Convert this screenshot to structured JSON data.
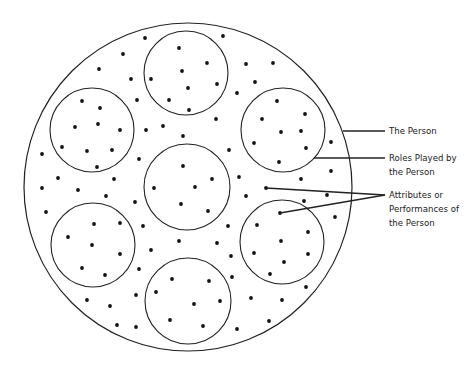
{
  "labels": {
    "person": "The Person",
    "roles_line1": "Roles Played by",
    "roles_line2": "the Person",
    "attr_line1": "Attributes or",
    "attr_line2": "Performances of",
    "attr_line3": "the Person"
  },
  "colors": {
    "stroke": "#222222",
    "dot": "#111111",
    "background": "#ffffff"
  },
  "outer_circle": {
    "cx": 188,
    "cy": 187,
    "r": 164
  },
  "inner_circles": [
    {
      "name": "role-top",
      "cx": 186,
      "cy": 73,
      "r": 42
    },
    {
      "name": "role-upper-left",
      "cx": 92,
      "cy": 130,
      "r": 42
    },
    {
      "name": "role-upper-right",
      "cx": 283,
      "cy": 130,
      "r": 42
    },
    {
      "name": "role-center",
      "cx": 187,
      "cy": 187,
      "r": 43
    },
    {
      "name": "role-lower-left",
      "cx": 93,
      "cy": 245,
      "r": 42
    },
    {
      "name": "role-lower-right",
      "cx": 282,
      "cy": 242,
      "r": 42
    },
    {
      "name": "role-bottom",
      "cx": 188,
      "cy": 301,
      "r": 43
    }
  ],
  "dots": [
    [
      145,
      38
    ],
    [
      223,
      36
    ],
    [
      123,
      54
    ],
    [
      99,
      69
    ],
    [
      131,
      79
    ],
    [
      151,
      79
    ],
    [
      179,
      48
    ],
    [
      207,
      63
    ],
    [
      182,
      71
    ],
    [
      217,
      84
    ],
    [
      188,
      88
    ],
    [
      169,
      100
    ],
    [
      189,
      110
    ],
    [
      246,
      64
    ],
    [
      273,
      63
    ],
    [
      255,
      82
    ],
    [
      237,
      93
    ],
    [
      137,
      100
    ],
    [
      82,
      101
    ],
    [
      100,
      108
    ],
    [
      98,
      124
    ],
    [
      75,
      127
    ],
    [
      120,
      130
    ],
    [
      62,
      147
    ],
    [
      87,
      151
    ],
    [
      112,
      150
    ],
    [
      97,
      167
    ],
    [
      146,
      130
    ],
    [
      163,
      126
    ],
    [
      183,
      136
    ],
    [
      216,
      119
    ],
    [
      42,
      154
    ],
    [
      139,
      159
    ],
    [
      229,
      150
    ],
    [
      277,
      101
    ],
    [
      305,
      114
    ],
    [
      262,
      119
    ],
    [
      281,
      132
    ],
    [
      301,
      131
    ],
    [
      254,
      143
    ],
    [
      306,
      148
    ],
    [
      279,
      162
    ],
    [
      331,
      142
    ],
    [
      331,
      171
    ],
    [
      301,
      179
    ],
    [
      183,
      166
    ],
    [
      212,
      179
    ],
    [
      195,
      187
    ],
    [
      154,
      188
    ],
    [
      239,
      177
    ],
    [
      58,
      178
    ],
    [
      114,
      179
    ],
    [
      42,
      188
    ],
    [
      78,
      190
    ],
    [
      266,
      188
    ],
    [
      106,
      196
    ],
    [
      135,
      202
    ],
    [
      181,
      204
    ],
    [
      208,
      211
    ],
    [
      246,
      196
    ],
    [
      304,
      201
    ],
    [
      327,
      195
    ],
    [
      335,
      217
    ],
    [
      280,
      213
    ],
    [
      46,
      212
    ],
    [
      94,
      224
    ],
    [
      120,
      223
    ],
    [
      68,
      237
    ],
    [
      92,
      245
    ],
    [
      120,
      254
    ],
    [
      82,
      268
    ],
    [
      105,
      275
    ],
    [
      143,
      226
    ],
    [
      151,
      250
    ],
    [
      179,
      241
    ],
    [
      217,
      243
    ],
    [
      228,
      226
    ],
    [
      231,
      256
    ],
    [
      257,
      225
    ],
    [
      308,
      232
    ],
    [
      281,
      241
    ],
    [
      254,
      253
    ],
    [
      308,
      254
    ],
    [
      284,
      262
    ],
    [
      270,
      274
    ],
    [
      139,
      269
    ],
    [
      232,
      277
    ],
    [
      172,
      279
    ],
    [
      209,
      281
    ],
    [
      156,
      292
    ],
    [
      220,
      301
    ],
    [
      194,
      304
    ],
    [
      170,
      320
    ],
    [
      203,
      326
    ],
    [
      136,
      295
    ],
    [
      251,
      298
    ],
    [
      282,
      300
    ],
    [
      306,
      287
    ],
    [
      87,
      300
    ],
    [
      110,
      306
    ],
    [
      117,
      325
    ],
    [
      136,
      327
    ],
    [
      237,
      329
    ],
    [
      269,
      321
    ]
  ],
  "leader_lines": [
    {
      "name": "person-leader",
      "x1": 343,
      "y1": 131,
      "x2": 385,
      "y2": 131
    },
    {
      "name": "roles-leader",
      "x1": 314,
      "y1": 158,
      "x2": 385,
      "y2": 158
    },
    {
      "name": "attribute-leader-1",
      "x1": 266,
      "y1": 188,
      "x2": 385,
      "y2": 195
    },
    {
      "name": "attribute-leader-2",
      "x1": 280,
      "y1": 213,
      "x2": 385,
      "y2": 195
    }
  ]
}
